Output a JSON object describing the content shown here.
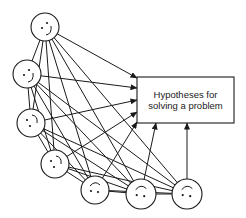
{
  "diagram": {
    "box": {
      "x": 137,
      "y": 77,
      "width": 97,
      "height": 46,
      "label_lines": [
        "Hypotheses for",
        "solving a problem"
      ]
    },
    "faces": [
      {
        "id": "person-1",
        "cx": 45,
        "cy": 27,
        "r": 14,
        "expression": "smile",
        "target": [
          137,
          78
        ]
      },
      {
        "id": "person-2",
        "cx": 27,
        "cy": 74,
        "r": 14,
        "expression": "smile",
        "target": [
          137,
          88
        ]
      },
      {
        "id": "person-3",
        "cx": 31,
        "cy": 123,
        "r": 14,
        "expression": "neutral",
        "target": [
          137,
          100
        ]
      },
      {
        "id": "person-4",
        "cx": 55,
        "cy": 164,
        "r": 14,
        "expression": "neutral",
        "target": [
          137,
          112
        ]
      },
      {
        "id": "person-5",
        "cx": 95,
        "cy": 190,
        "r": 14,
        "expression": "frown",
        "target": [
          137,
          122
        ]
      },
      {
        "id": "person-6",
        "cx": 141,
        "cy": 194,
        "r": 15,
        "expression": "frown",
        "target": [
          156,
          123
        ]
      },
      {
        "id": "person-7",
        "cx": 187,
        "cy": 194,
        "r": 15,
        "expression": "frown",
        "target": [
          187,
          123
        ]
      }
    ],
    "connections": "all-pairs",
    "colors": {
      "ink": "#1a1a1a",
      "background": "#ffffff"
    }
  }
}
